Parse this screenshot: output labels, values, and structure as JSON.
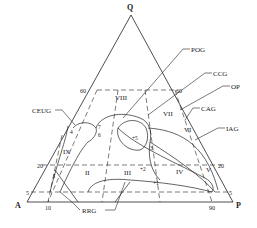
{
  "vertices": {
    "top": "Q",
    "left": "A",
    "right": "P"
  },
  "tick_labels": {
    "left_60": "60",
    "right_60": "60",
    "left_20": "20",
    "right_20": "20",
    "left_5": "5",
    "right_5": "5",
    "base_10": "10",
    "base_90": "90"
  },
  "fields": {
    "I": "I",
    "II": "II",
    "III": "III",
    "IV": "IV",
    "V": "V",
    "VI": "VI",
    "VII": "VII",
    "VIII": "VIII",
    "IX": "IX"
  },
  "points": {
    "p1": "+1",
    "p2": "+2",
    "p3": "3",
    "p4": "4",
    "p5": "+5",
    "p6": "6",
    "p7": "7"
  },
  "callouts": {
    "pog": "POG",
    "ccg": "CCG",
    "op": "OP",
    "cag": "CAG",
    "iag": "IAG",
    "ceug": "CEUG",
    "rrg": "RRG"
  },
  "colors": {
    "line": "#222222",
    "background": "#ffffff"
  }
}
